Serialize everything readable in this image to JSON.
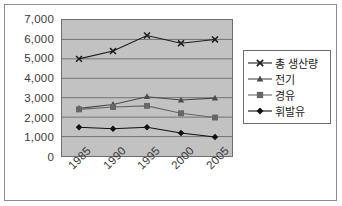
{
  "chart_data": {
    "type": "line",
    "title": "",
    "subtitle": "",
    "xlabel": "",
    "ylabel": "",
    "categories": [
      "1985",
      "1990",
      "1995",
      "2000",
      "2005"
    ],
    "ylim": [
      0,
      7000
    ],
    "ytick_labels": [
      "7,000",
      "6,000",
      "5,000",
      "4,000",
      "3,000",
      "2,000",
      "1,000",
      "0"
    ],
    "ytick_values": [
      7000,
      6000,
      5000,
      4000,
      3000,
      2000,
      1000,
      0
    ],
    "grid": true,
    "grid_axis": "y",
    "legend_position": "right",
    "plot_background": "#c2c2c2",
    "series": [
      {
        "name": "총 생산량",
        "marker": "x-cross",
        "color": "#1c1c1c",
        "values": [
          5000,
          5400,
          6200,
          5800,
          6000
        ]
      },
      {
        "name": "전기",
        "marker": "triangle",
        "color": "#4a4a4a",
        "values": [
          2450,
          2650,
          3050,
          2880,
          2980
        ]
      },
      {
        "name": "경유",
        "marker": "square",
        "color": "#666666",
        "values": [
          2400,
          2520,
          2580,
          2200,
          1980
        ]
      },
      {
        "name": "휘발유",
        "marker": "diamond",
        "color": "#111111",
        "values": [
          1480,
          1400,
          1480,
          1180,
          980
        ]
      }
    ]
  }
}
